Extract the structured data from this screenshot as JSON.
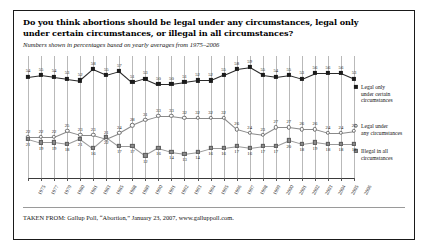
{
  "title": "Do you think abortions should be legal under any circumstances, legal only under certain circumstances, or illegal in all circumstances?",
  "subtitle": "Numbers shown in percentages based on yearly averages from 1975–2006",
  "source": "TAKEN FROM: Gallup Poll, “Abortion,” January 23, 2007, www.galluppoll.com.",
  "legend": {
    "legal_only_certain": "Legal only\nunder certain\ncircumstances",
    "legal_any": "Legal under\nany circumstances",
    "illegal_all": "Illegal in all\ncircumstances"
  },
  "colors": {
    "legal_only_certain": "#1b1b1b",
    "legal_any": "#ffffff",
    "illegal_all": "#8d8d8d",
    "gridline": "#b9b9b9",
    "border": "#1a1a1a"
  },
  "chart_data": {
    "type": "line",
    "title": "Do you think abortions should be legal under any circumstances, legal only under certain circumstances, or illegal in all circumstances?",
    "subtitle": "Numbers shown in percentages based on yearly averages from 1975–2006",
    "xlabel": "",
    "ylabel": "Percent",
    "ylim": [
      0,
      65
    ],
    "grid": true,
    "legend_position": "right",
    "categories": [
      "1975",
      "1977",
      "1979",
      "1980",
      "1981",
      "1983",
      "1985",
      "1988",
      "1989",
      "1990",
      "1991",
      "1992",
      "1993",
      "1994",
      "1995",
      "1996",
      "1997",
      "1998",
      "1999",
      "2000",
      "2001",
      "2002",
      "2003",
      "2004",
      "2005",
      "2006"
    ],
    "series": [
      {
        "name": "Legal only under certain circumstances",
        "marker": "filled-square",
        "values": [
          54,
          55,
          54,
          53,
          52,
          58,
          55,
          57,
          51,
          53,
          50,
          50,
          51,
          52,
          52,
          55,
          58,
          59,
          55,
          54,
          55,
          53,
          56,
          56,
          56,
          53
        ]
      },
      {
        "name": "Legal under any circumstances",
        "marker": "open-circle",
        "values": [
          22,
          22,
          22,
          25,
          23,
          23,
          21,
          24,
          28,
          31,
          33,
          33,
          32,
          32,
          32,
          32,
          26,
          24,
          23,
          27,
          27,
          26,
          26,
          24,
          24,
          25
        ]
      },
      {
        "name": "Illegal in all circumstances",
        "marker": "gray-square",
        "values": [
          21,
          19,
          19,
          18,
          21,
          16,
          22,
          17,
          17,
          12,
          16,
          14,
          13,
          14,
          16,
          16,
          17,
          16,
          17,
          17,
          20,
          18,
          19,
          18,
          18,
          18
        ]
      }
    ]
  }
}
